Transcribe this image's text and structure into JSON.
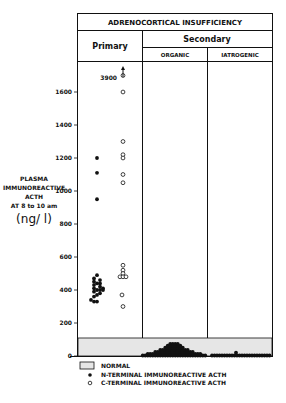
{
  "chart_data": {
    "type": "scatter",
    "title": "ADRENOCORTICAL INSUFFICIENCY",
    "header": {
      "top": "ADRENOCORTICAL INSUFFICIENCY",
      "primary": "Primary",
      "secondary": "Secondary",
      "organic": "ORGANIC",
      "iatrogenic": "IATROGENIC"
    },
    "ylabel_lines": [
      "PLASMA",
      "IMMUNOREACTIVE",
      "ACTH",
      "AT 8 to 10 am"
    ],
    "ylabel_unit": "(ng/ l)",
    "yticks": [
      0,
      200,
      400,
      600,
      800,
      1000,
      1200,
      1400,
      1600
    ],
    "ylim": [
      0,
      1700
    ],
    "normal_range": [
      0,
      110
    ],
    "annotation": {
      "text": "3900",
      "series": "C-terminal",
      "group": "Primary",
      "value": 3900,
      "note": "off-scale, arrow up"
    },
    "groups": [
      "Primary",
      "Secondary - Organic",
      "Secondary - Iatrogenic"
    ],
    "series": [
      {
        "name": "N-TERMINAL IMMUNOREACTIVE ACTH",
        "marker": "filled",
        "group": "Primary",
        "values": [
          1200,
          1110,
          950,
          490,
          470,
          460,
          450,
          440,
          440,
          430,
          420,
          410,
          410,
          400,
          400,
          400,
          390,
          380,
          370,
          360,
          340,
          330,
          330
        ]
      },
      {
        "name": "C-TERMINAL IMMUNOREACTIVE ACTH",
        "marker": "open",
        "group": "Primary",
        "values": [
          1700,
          1600,
          1300,
          1220,
          1200,
          1100,
          1050,
          550,
          520,
          500,
          480,
          480,
          480,
          370,
          300
        ]
      },
      {
        "name": "N-TERMINAL IMMUNOREACTIVE ACTH",
        "marker": "filled",
        "group": "Secondary - Organic",
        "note": "cluster of ~60 points, all within 0–80 ng/l",
        "values_range": [
          0,
          80
        ]
      },
      {
        "name": "N-TERMINAL IMMUNOREACTIVE ACTH",
        "marker": "filled",
        "group": "Secondary - Iatrogenic",
        "note": "row of ~20 points near 0, one at ~25 ng/l",
        "values_range": [
          0,
          25
        ]
      }
    ],
    "legend": [
      {
        "symbol": "shaded-box",
        "label": "NORMAL"
      },
      {
        "symbol": "filled-circle",
        "label": "N-TERMINAL IMMUNOREACTIVE ACTH"
      },
      {
        "symbol": "open-circle",
        "label": "C-TERMINAL IMMUNOREACTIVE ACTH"
      }
    ],
    "colors": {
      "ink": "#111111",
      "normal_fill": "#e6e6e6",
      "background": "#ffffff"
    }
  }
}
